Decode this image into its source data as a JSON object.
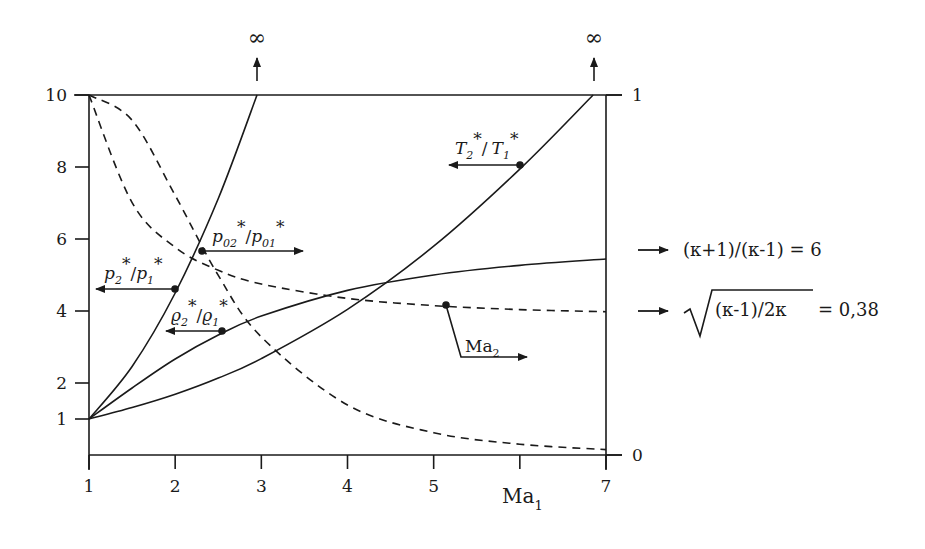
{
  "chart_data": {
    "type": "line",
    "title": "",
    "xlabel": "Ma₁",
    "xlabel_main": "Ma",
    "xlabel_sub": "1",
    "xlim": [
      1,
      7
    ],
    "x_ticks": [
      1,
      2,
      3,
      4,
      5,
      6,
      7
    ],
    "x_tick_labels": [
      "1",
      "2",
      "3",
      "4",
      "5",
      "",
      "7"
    ],
    "ylabel_left": "",
    "ylim_left": [
      0,
      10
    ],
    "y_left_ticks": [
      1,
      2,
      4,
      6,
      8,
      10
    ],
    "y_left_tick_labels": [
      "1",
      "2",
      "4",
      "6",
      "8",
      "10"
    ],
    "ylim_right": [
      0,
      1
    ],
    "y_right_tick_labels": [
      "0",
      "1"
    ],
    "grid": false,
    "legend": "none (inline labels with arrows pointing to the relevant axis)",
    "top_annotations": [
      {
        "symbol": "∞",
        "x": 2.95,
        "note": "p2*/p1* tends to infinity"
      },
      {
        "symbol": "∞",
        "x": 6.85,
        "note": "T2*/T1* tends to infinity"
      }
    ],
    "series": [
      {
        "name": "p2*/p1*",
        "axis": "left",
        "style": "solid",
        "x": [
          1,
          1.5,
          2,
          2.5,
          2.95
        ],
        "values": [
          1.0,
          2.458,
          4.5,
          7.125,
          10.0
        ]
      },
      {
        "name": "ϱ2*/ϱ1*",
        "axis": "left",
        "style": "solid",
        "x": [
          1,
          1.5,
          2,
          2.5,
          3,
          4,
          5,
          6,
          7
        ],
        "values": [
          1.0,
          1.862,
          2.667,
          3.333,
          3.857,
          4.571,
          5.0,
          5.268,
          5.444
        ]
      },
      {
        "name": "T2*/T1*",
        "axis": "left",
        "style": "solid",
        "x": [
          1,
          1.5,
          2,
          2.5,
          3,
          4,
          5,
          6,
          6.85
        ],
        "values": [
          1.0,
          1.32,
          1.688,
          2.138,
          2.679,
          4.047,
          5.8,
          7.941,
          10.0
        ]
      },
      {
        "name": "p02*/p01*",
        "axis": "right",
        "style": "dashed",
        "x": [
          1,
          1.5,
          2,
          2.5,
          3,
          4,
          5,
          6,
          7
        ],
        "values": [
          1.0,
          0.93,
          0.721,
          0.499,
          0.328,
          0.139,
          0.062,
          0.03,
          0.015
        ]
      },
      {
        "name": "Ma2",
        "axis": "right",
        "style": "dashed",
        "x": [
          1,
          1.5,
          2,
          2.5,
          3,
          4,
          5,
          6,
          7
        ],
        "values": [
          1.0,
          0.701,
          0.577,
          0.513,
          0.475,
          0.435,
          0.415,
          0.404,
          0.398
        ]
      }
    ],
    "asymptotes": [
      {
        "label": "(κ+1)/(κ-1) = 6",
        "value": 6,
        "applies_to": "ϱ2*/ϱ1*"
      },
      {
        "label": "√((κ-1)/2κ) = 0,38",
        "value": 0.38,
        "applies_to": "Ma2"
      }
    ]
  },
  "labels": {
    "p_ratio": {
      "base1": "p",
      "sub1": "2",
      "base2": "p",
      "sub2": "1",
      "star": "*"
    },
    "rho_ratio": {
      "base1": "ϱ",
      "sub1": "2",
      "base2": "ϱ",
      "sub2": "1",
      "star": "*"
    },
    "T_ratio": {
      "base1": "T",
      "sub1": "2",
      "base2": "T",
      "sub2": "1",
      "star": "*"
    },
    "p0_ratio": {
      "base1": "p",
      "sub1": "02",
      "base2": "p",
      "sub2": "01",
      "star": "*"
    },
    "ma2": {
      "base": "Ma",
      "sub": "2"
    },
    "slash": "/",
    "infinity": "∞",
    "limit_rho": "(κ+1)/(κ-1) = 6",
    "limit_ma2_radicand": "(κ-1)/2κ",
    "limit_ma2_value": "= 0,38"
  },
  "colors": {
    "ink": "#1a1a1a",
    "background": "#ffffff"
  }
}
